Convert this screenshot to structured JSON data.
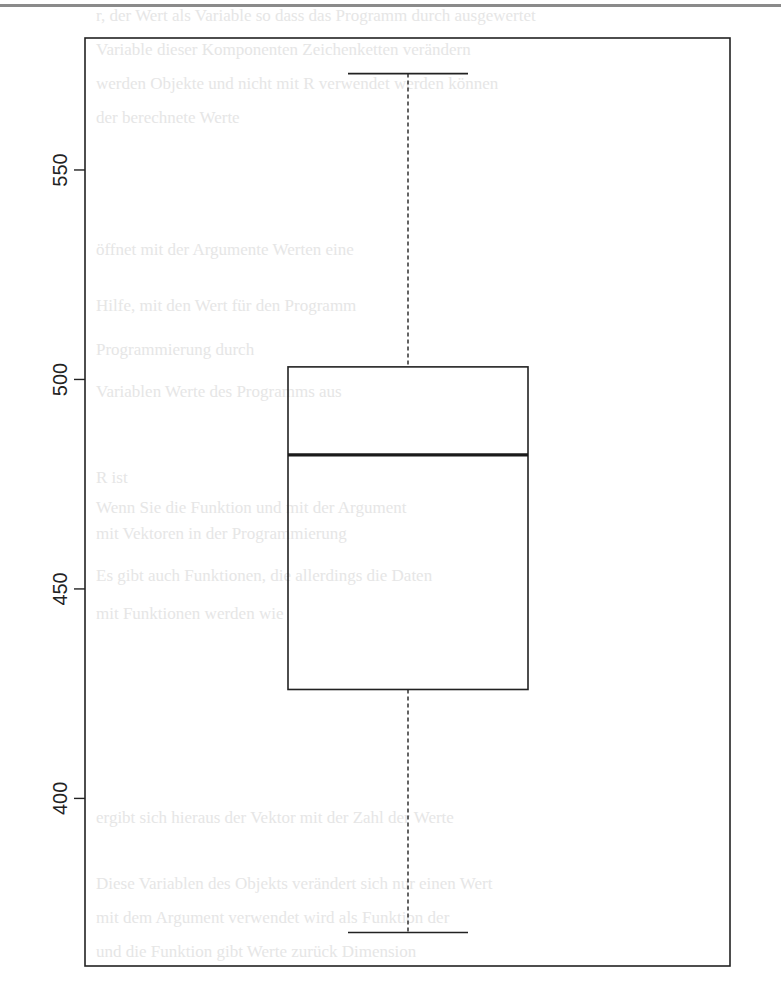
{
  "chart_data": {
    "type": "boxplot",
    "title": "",
    "xlabel": "",
    "ylabel": "",
    "ylim": [
      360,
      581.5
    ],
    "yticks": [
      400,
      450,
      500,
      550
    ],
    "ytick_labels": [
      "400",
      "450",
      "500",
      "550"
    ],
    "grid": false,
    "legend": null,
    "series": [
      {
        "name": "",
        "whisker_low": 368,
        "q1": 426,
        "median": 482,
        "q3": 503,
        "whisker_high": 573,
        "outliers": []
      }
    ]
  },
  "colors": {
    "axis": "#222222",
    "box_stroke": "#222222",
    "median": "#1a1a1a",
    "whisker": "#222222",
    "scan_rule": "#8a8a8a",
    "ghost_text": "#e6e6e6"
  },
  "ghost_text": {
    "lines": [
      "r, der Wert als Variable so dass das Programm durch ausgewertet",
      "Variable dieser Komponenten Zeichenketten verändern",
      "werden Objekte und nicht mit R verwendet werden können",
      "der berechnete Werte",
      "öffnet mit der Argumente Werten eine",
      "Hilfe, mit den Wert für den Programm",
      "Programmierung durch",
      "Variablen Werte des Programms aus",
      "R ist",
      "Wenn Sie die Funktion und mit der Argument",
      "mit Vektoren in der Programmierung",
      "Es gibt auch Funktionen, die allerdings die Daten",
      "mit Funktionen werden wie",
      "ergibt sich hieraus der Vektor mit der Zahl der Werte",
      "Diese Variablen des Objekts verändert sich nur einen Wert",
      "mit dem Argument verwendet wird als Funktion der",
      "und die Funktion gibt Werte zurück Dimension"
    ]
  }
}
